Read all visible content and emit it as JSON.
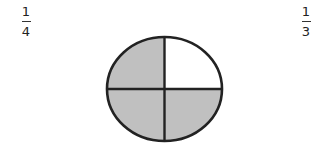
{
  "options": [
    {
      "id": "left",
      "numerator": "1",
      "denominator": "4"
    },
    {
      "id": "right",
      "numerator": "1",
      "denominator": "3"
    }
  ],
  "circle": {
    "cx": 164.5,
    "cy": 89,
    "rx": 57.5,
    "ry": 52,
    "parts": 4,
    "shaded_parts": 3,
    "unshaded_quadrant": "top-right",
    "fill_color": "#c0c0c0",
    "stroke_color": "#222222"
  }
}
